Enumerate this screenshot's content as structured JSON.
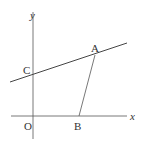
{
  "diagram": {
    "axes": {
      "x_label": "x",
      "y_label": "y",
      "origin_label": "O"
    },
    "points": {
      "A": {
        "label": "A"
      },
      "B": {
        "label": "B"
      },
      "C": {
        "label": "C"
      }
    },
    "colors": {
      "line": "#444444",
      "text": "#333333"
    }
  }
}
